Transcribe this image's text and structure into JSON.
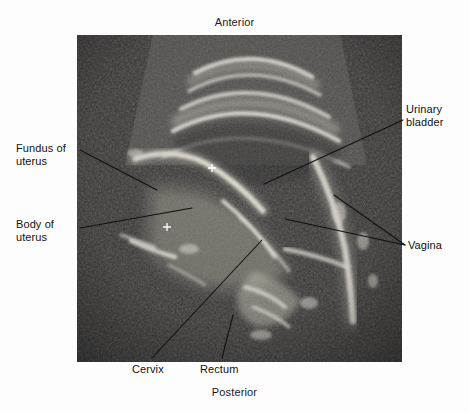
{
  "figure": {
    "kind": "anatomical-ultrasound-figure",
    "modality": "ultrasound",
    "view": "midsagittal pelvic scan",
    "plate": {
      "background_color": "#2f2f2f",
      "speckle_dark": "#303030",
      "speckle_mid": "#6a6a6a",
      "echogenic_bright": "#f2f0e8"
    },
    "page_background": "#fdfdfd",
    "text_color": "#111111",
    "leader_line_color": "#101010"
  },
  "orientation": {
    "top_label": "Anterior",
    "bottom_label": "Posterior"
  },
  "labels": [
    {
      "id": "fundus",
      "text": "Fundus of\nuterus",
      "side": "left"
    },
    {
      "id": "body",
      "text": "Body of\nuterus",
      "side": "left"
    },
    {
      "id": "bladder",
      "text": "Urinary\nbladder",
      "side": "right"
    },
    {
      "id": "vagina",
      "text": "Vagina",
      "side": "right"
    },
    {
      "id": "cervix",
      "text": "Cervix",
      "side": "bottom"
    },
    {
      "id": "rectum",
      "text": "Rectum",
      "side": "bottom"
    }
  ],
  "structures": [
    "Urinary bladder",
    "Fundus of uterus",
    "Body of uterus",
    "Cervix",
    "Vagina",
    "Rectum"
  ],
  "caliper_markers": [
    {
      "glyph": "+",
      "x": 212,
      "y": 173
    },
    {
      "glyph": "+",
      "x": 167,
      "y": 230
    }
  ]
}
